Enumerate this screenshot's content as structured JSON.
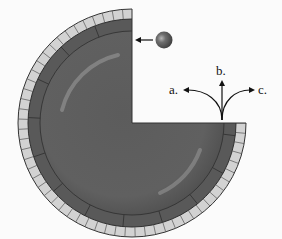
{
  "diagram": {
    "type": "physics-circular-track",
    "ball": {
      "label": "",
      "color": "#5a5a5a"
    },
    "exit_paths": [
      {
        "id": "a",
        "label": "a."
      },
      {
        "id": "b",
        "label": "b."
      },
      {
        "id": "c",
        "label": "c."
      }
    ],
    "colors": {
      "background": "#fbfbfb",
      "tube_dark": "#555555",
      "tube_highlight": "#8a8a8a",
      "outer_tiles": "#cfcfcf",
      "outline": "#333333"
    }
  }
}
